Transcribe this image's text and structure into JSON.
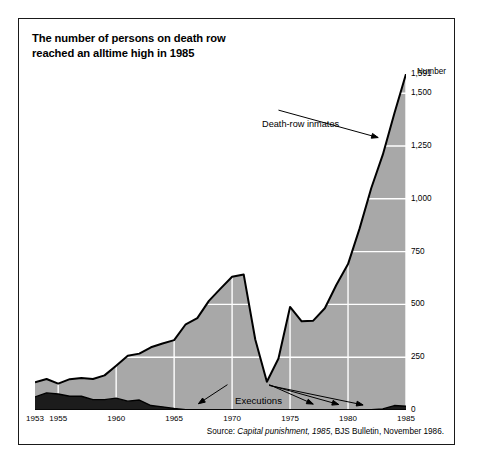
{
  "title": {
    "line1": "The number of persons on death row",
    "line2": "reached an alltime high in 1985"
  },
  "axis_title": "Number",
  "annotations": {
    "inmates": "Death-row inmates",
    "executions": "Executions"
  },
  "source": {
    "prefix": "Source: ",
    "italic": "Capital punishment, 1985",
    "suffix": ", BJS Bulletin, November 1986."
  },
  "colors": {
    "inmates_fill": "#a8a8a8",
    "executions_fill": "#1c1c1c",
    "line": "#000000",
    "grid": "#ffffff",
    "frame": "#1a1a1a",
    "text": "#000000"
  },
  "chart_data": {
    "type": "area",
    "title": "The number of persons on death row reached an alltime high in 1985",
    "xlabel": "",
    "ylabel": "Number",
    "xlim": [
      1953,
      1985
    ],
    "ylim": [
      0,
      1591
    ],
    "grid": true,
    "legend_position": "inline-annotation",
    "yticks": [
      0,
      250,
      500,
      750,
      1000,
      1250,
      1500,
      1591
    ],
    "ytick_labels": [
      "0",
      "250",
      "500",
      "750",
      "1,000",
      "1,250",
      "1,500",
      "1,591"
    ],
    "xticks": [
      1953,
      1955,
      1960,
      1965,
      1970,
      1975,
      1980,
      1985
    ],
    "xtick_labels": [
      "1953",
      "1955",
      "1960",
      "1965",
      "1970",
      "1975",
      "1980",
      "1985"
    ],
    "x": [
      1953,
      1954,
      1955,
      1956,
      1957,
      1958,
      1959,
      1960,
      1961,
      1962,
      1963,
      1964,
      1965,
      1966,
      1967,
      1968,
      1969,
      1970,
      1971,
      1972,
      1973,
      1974,
      1975,
      1976,
      1977,
      1978,
      1979,
      1980,
      1981,
      1982,
      1983,
      1984,
      1985
    ],
    "series": [
      {
        "name": "Death-row inmates",
        "annotation": "Death-row inmates",
        "fill": "#a8a8a8",
        "values": [
          131,
          147,
          125,
          146,
          151,
          147,
          164,
          210,
          257,
          267,
          297,
          315,
          331,
          406,
          435,
          517,
          575,
          631,
          642,
          334,
          134,
          244,
          488,
          420,
          423,
          482,
          593,
          691,
          860,
          1050,
          1209,
          1405,
          1591
        ]
      },
      {
        "name": "Executions",
        "annotation": "Executions",
        "fill": "#1c1c1c",
        "values": [
          62,
          81,
          76,
          65,
          65,
          49,
          49,
          56,
          42,
          47,
          21,
          15,
          7,
          1,
          2,
          0,
          0,
          0,
          0,
          0,
          0,
          0,
          0,
          0,
          1,
          0,
          2,
          0,
          1,
          2,
          5,
          21,
          18
        ]
      }
    ],
    "annotation_pointers": {
      "death_row_inmates": {
        "label_at_year": 1973,
        "points_to_year": 1983
      },
      "executions": {
        "label_at_year": 1972,
        "points_to_years": [
          1967,
          1977,
          1979,
          1981
        ]
      }
    },
    "note": "Peak of 1,591 death-row inmates in 1985; trough of 134 in 1973 following Furman v. Georgia."
  }
}
